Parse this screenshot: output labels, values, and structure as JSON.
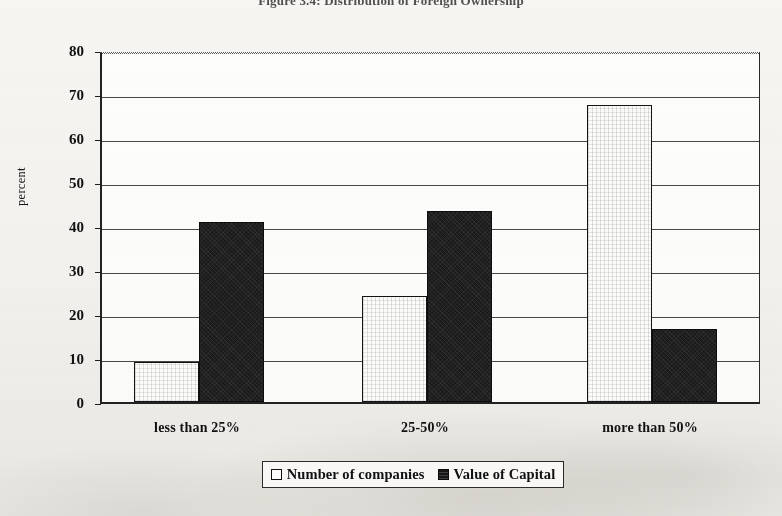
{
  "figure": {
    "title": "Figure 3.4: Distribution of Foreign Ownership"
  },
  "chart_data": {
    "type": "bar",
    "title": "Figure 3.4: Distribution of Foreign Ownership",
    "xlabel": "",
    "ylabel": "percent",
    "categories": [
      "less than 25%",
      "25-50%",
      "more than 50%"
    ],
    "series": [
      {
        "name": "Number of companies",
        "values": [
          9,
          24,
          67.5
        ],
        "color": "#fbfbfa"
      },
      {
        "name": "Value of Capital",
        "values": [
          41,
          43.5,
          16.5
        ],
        "color": "#1b1b1b"
      }
    ],
    "ylim": [
      0,
      80
    ],
    "yticks": [
      0,
      10,
      20,
      30,
      40,
      50,
      60,
      70,
      80
    ],
    "ytick_labels": [
      "0",
      "10",
      "20",
      "30",
      "40",
      "50",
      "60",
      "70",
      "80"
    ],
    "grid": true,
    "legend_position": "bottom"
  },
  "legend": {
    "entries": [
      {
        "label": "Number of companies",
        "swatch": "white"
      },
      {
        "label": "Value of Capital",
        "swatch": "black"
      }
    ]
  }
}
